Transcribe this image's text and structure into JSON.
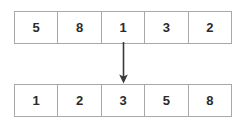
{
  "diagram": {
    "name": "array-sort-transformation",
    "background_color": "#ffffff",
    "border_color": "#a8a8a8",
    "text_color": "#2b2b2b",
    "arrow_color": "#3a3a3a"
  },
  "input_array": {
    "label": "unsorted-array",
    "cells": [
      {
        "value": "5"
      },
      {
        "value": "8"
      },
      {
        "value": "1"
      },
      {
        "value": "3"
      },
      {
        "value": "2"
      }
    ]
  },
  "output_array": {
    "label": "sorted-array",
    "cells": [
      {
        "value": "1"
      },
      {
        "value": "2"
      },
      {
        "value": "3"
      },
      {
        "value": "5"
      },
      {
        "value": "8"
      }
    ]
  },
  "arrow": {
    "name": "downward-arrow",
    "direction": "down",
    "from": "input-array-middle-cell",
    "to": "output-array-middle-cell"
  }
}
